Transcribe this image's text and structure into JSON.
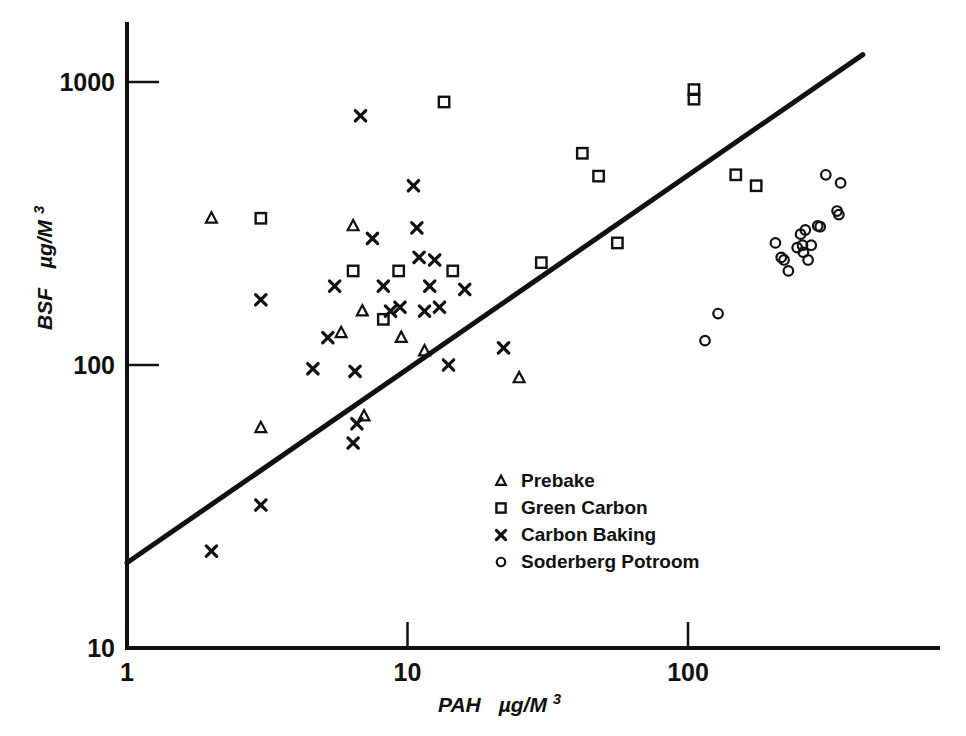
{
  "chart_data": {
    "type": "scatter",
    "title": "",
    "xlabel": "PAH  µg/M³",
    "ylabel": "BSF  µg/M³",
    "xscale": "log",
    "yscale": "log",
    "xlim": [
      1,
      700
    ],
    "ylim": [
      10,
      1400
    ],
    "xticks": [
      1,
      10,
      100
    ],
    "xticklabels": [
      "1",
      "10",
      "100"
    ],
    "yticks": [
      10,
      100,
      1000
    ],
    "yticklabels": [
      "10",
      "100",
      "1000"
    ],
    "grid": false,
    "legend_position": "center-right-lower",
    "trendline": {
      "label": "",
      "x": [
        1,
        420
      ],
      "y": [
        20,
        1250
      ]
    },
    "series": [
      {
        "name": "Prebake",
        "marker": "triangle",
        "points": [
          [
            2.0,
            330
          ],
          [
            6.4,
            310
          ],
          [
            5.8,
            130
          ],
          [
            6.9,
            155
          ],
          [
            9.5,
            125
          ],
          [
            3.0,
            60
          ],
          [
            7.0,
            66
          ],
          [
            11.5,
            112
          ],
          [
            25.0,
            90
          ]
        ]
      },
      {
        "name": "Green Carbon",
        "marker": "square",
        "points": [
          [
            3.0,
            330
          ],
          [
            6.4,
            215
          ],
          [
            13.5,
            850
          ],
          [
            14.5,
            215
          ],
          [
            9.3,
            215
          ],
          [
            8.2,
            145
          ],
          [
            30.0,
            230
          ],
          [
            42.0,
            560
          ],
          [
            48.0,
            465
          ],
          [
            56.0,
            270
          ],
          [
            105.0,
            940
          ],
          [
            105.0,
            870
          ],
          [
            148.0,
            470
          ],
          [
            175.0,
            430
          ]
        ]
      },
      {
        "name": "Carbon Baking",
        "marker": "cross",
        "points": [
          [
            2.0,
            22
          ],
          [
            3.0,
            32
          ],
          [
            3.0,
            170
          ],
          [
            4.6,
            97
          ],
          [
            5.5,
            190
          ],
          [
            5.2,
            125
          ],
          [
            6.4,
            53
          ],
          [
            6.6,
            62
          ],
          [
            6.5,
            95
          ],
          [
            6.8,
            760
          ],
          [
            7.5,
            280
          ],
          [
            8.2,
            190
          ],
          [
            8.7,
            155
          ],
          [
            9.4,
            160
          ],
          [
            10.5,
            430
          ],
          [
            10.8,
            305
          ],
          [
            11.0,
            240
          ],
          [
            11.5,
            155
          ],
          [
            12.0,
            190
          ],
          [
            12.5,
            235
          ],
          [
            13.0,
            160
          ],
          [
            14.0,
            100
          ],
          [
            16.0,
            185
          ],
          [
            22.0,
            115
          ]
        ]
      },
      {
        "name": "Soderberg Potroom",
        "marker": "circle",
        "points": [
          [
            115.0,
            122
          ],
          [
            128.0,
            152
          ],
          [
            205.0,
            270
          ],
          [
            215.0,
            240
          ],
          [
            220.0,
            235
          ],
          [
            228.0,
            215
          ],
          [
            245.0,
            260
          ],
          [
            252.0,
            290
          ],
          [
            256.0,
            265
          ],
          [
            258.0,
            250
          ],
          [
            262.0,
            300
          ],
          [
            268.0,
            235
          ],
          [
            275.0,
            265
          ],
          [
            290.0,
            310
          ],
          [
            296.0,
            308
          ],
          [
            310.0,
            470
          ],
          [
            350.0,
            440
          ],
          [
            340.0,
            350
          ],
          [
            345.0,
            340
          ]
        ]
      }
    ]
  },
  "legend": {
    "items": [
      {
        "label": "Prebake",
        "marker": "triangle"
      },
      {
        "label": "Green Carbon",
        "marker": "square"
      },
      {
        "label": "Carbon Baking",
        "marker": "cross"
      },
      {
        "label": "Soderberg Potroom",
        "marker": "circle"
      }
    ]
  },
  "axes": {
    "y_title_main": "BSF",
    "y_title_units": "µg/M",
    "y_title_sup": "3",
    "x_title_main": "PAH",
    "x_title_units": "µg/M",
    "x_title_sup": "3"
  }
}
